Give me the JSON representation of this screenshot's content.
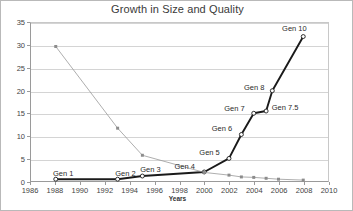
{
  "chart_data": {
    "type": "line",
    "title": "Growth in Size and Quality",
    "xlabel": "Years",
    "ylabel": "",
    "xlim": [
      1986,
      2010
    ],
    "ylim": [
      0,
      35
    ],
    "xticks": [
      1986,
      1988,
      1990,
      1992,
      1994,
      1996,
      1998,
      2000,
      2002,
      2004,
      2006,
      2008,
      2010
    ],
    "yticks": [
      0,
      5,
      10,
      15,
      20,
      25,
      30,
      35
    ],
    "grid": "horizontal",
    "legend": "none",
    "series": [
      {
        "name": "Generations",
        "color": "#1a1a1a",
        "marker": "open-circle",
        "x": [
          1988,
          1993,
          1995,
          2000,
          2002,
          2003,
          2004,
          2005,
          2005.5,
          2008
        ],
        "y": [
          0.4,
          0.4,
          1.1,
          2.0,
          5.0,
          10.3,
          15.0,
          15.5,
          20.0,
          32.0
        ],
        "labels": [
          "Gen 1",
          "Gen 2",
          "Gen 3",
          "Gen 4",
          "Gen 5",
          "Gen 6",
          "Gen 7",
          "Gen 7.5",
          "Gen 8",
          "Gen 10"
        ]
      },
      {
        "name": "Decline",
        "color": "#999999",
        "marker": "small-square",
        "x": [
          1988,
          1993,
          1995,
          2000,
          2002,
          2003,
          2004,
          2005,
          2006,
          2008
        ],
        "y": [
          29.8,
          11.7,
          5.7,
          1.9,
          1.3,
          0.9,
          0.8,
          0.6,
          0.4,
          0.2
        ],
        "labels": [
          "",
          "",
          "",
          "",
          "",
          "",
          "",
          "",
          "",
          ""
        ]
      }
    ],
    "point_labels": [
      {
        "text": "Gen 1",
        "x": 1988,
        "y": 0.4,
        "dx": -2,
        "dy": -11
      },
      {
        "text": "Gen 2",
        "x": 1993,
        "y": 0.4,
        "dx": -2,
        "dy": -11
      },
      {
        "text": "Gen 3",
        "x": 1995,
        "y": 1.1,
        "dx": -2,
        "dy": -12
      },
      {
        "text": "Gen 4",
        "x": 2000,
        "y": 2.0,
        "dx": -30,
        "dy": -11
      },
      {
        "text": "Gen 5",
        "x": 2002,
        "y": 5.0,
        "dx": -30,
        "dy": -11
      },
      {
        "text": "Gen 6",
        "x": 2003,
        "y": 10.3,
        "dx": -30,
        "dy": -11
      },
      {
        "text": "Gen 7",
        "x": 2004,
        "y": 15.0,
        "dx": -30,
        "dy": -9
      },
      {
        "text": "Gen 7.5",
        "x": 2005,
        "y": 15.5,
        "dx": 5,
        "dy": -8
      },
      {
        "text": "Gen 8",
        "x": 2005.5,
        "y": 20.0,
        "dx": -29,
        "dy": -8
      },
      {
        "text": "Gen 10",
        "x": 2008,
        "y": 32.0,
        "dx": -22,
        "dy": -12
      }
    ]
  }
}
